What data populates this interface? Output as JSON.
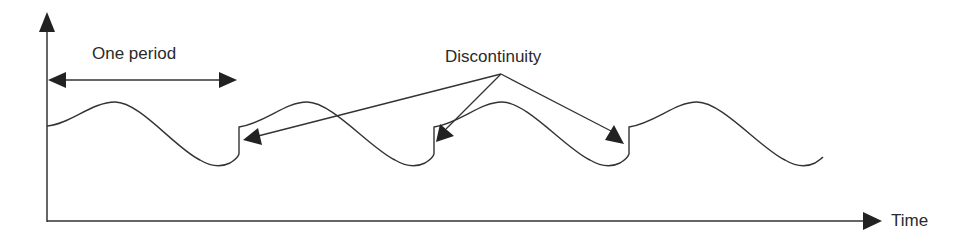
{
  "diagram": {
    "labels": {
      "period": "One period",
      "discontinuity": "Discontinuity",
      "x_axis": "Time"
    },
    "colors": {
      "stroke": "#333333",
      "text": "#2a2a2a",
      "background": "#ffffff"
    },
    "periods": 4,
    "discontinuity_count": 3
  }
}
